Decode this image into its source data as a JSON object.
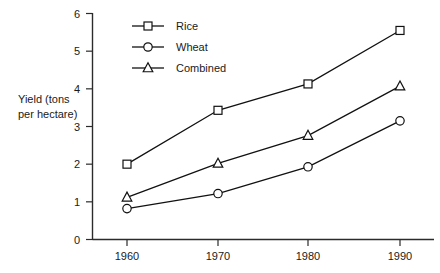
{
  "chart_data": {
    "type": "line",
    "title": "",
    "xlabel": "",
    "ylabel": "Yield (tons per hectare)",
    "ylabel_line1": "Yield (tons",
    "ylabel_line2": "per hectare)",
    "x": [
      1960,
      1970,
      1980,
      1990
    ],
    "xtick_labels": [
      "1960",
      "1970",
      "1980",
      "1990"
    ],
    "ytick_labels": [
      "0",
      "1",
      "2",
      "3",
      "4",
      "5",
      "6"
    ],
    "yticks": [
      0,
      1,
      2,
      3,
      4,
      5,
      6
    ],
    "ylim": [
      0,
      6
    ],
    "xlim": [
      1955,
      1995
    ],
    "grid": false,
    "legend_position": "top-left",
    "series": [
      {
        "name": "Rice",
        "marker": "square",
        "color": "#111111",
        "values": [
          2.0,
          3.43,
          4.13,
          5.55
        ]
      },
      {
        "name": "Wheat",
        "marker": "circle",
        "color": "#111111",
        "values": [
          0.82,
          1.22,
          1.93,
          3.15
        ]
      },
      {
        "name": "Combined",
        "marker": "triangle",
        "color": "#111111",
        "values": [
          1.12,
          2.02,
          2.76,
          4.07
        ]
      }
    ],
    "legend": [
      {
        "label": "Rice",
        "marker": "square"
      },
      {
        "label": "Wheat",
        "marker": "circle"
      },
      {
        "label": "Combined",
        "marker": "triangle"
      }
    ]
  }
}
